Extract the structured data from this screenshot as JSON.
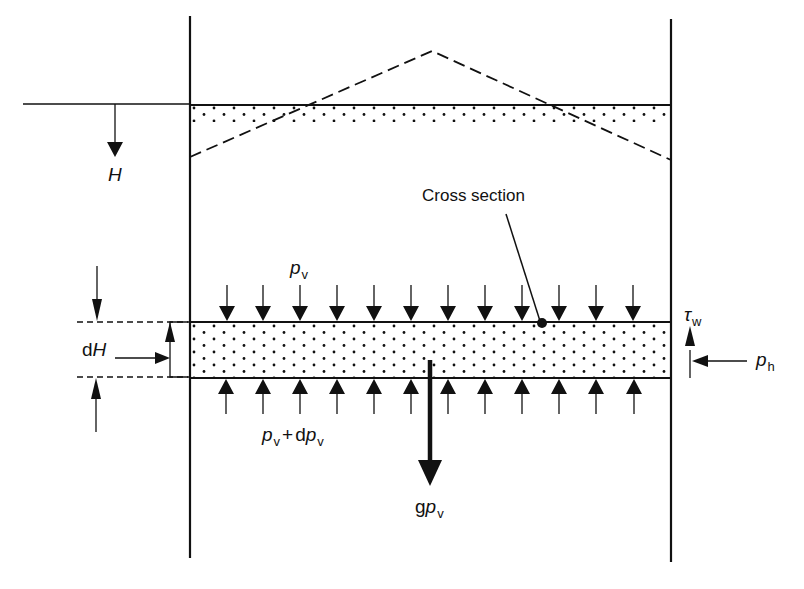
{
  "diagram": {
    "labels": {
      "depth": "H",
      "cross_section": "Cross section",
      "dH_prefix": "d",
      "dH_var": "H",
      "pv_var": "p",
      "pv_sub": "v",
      "pv_plus": "+",
      "pv_d": "d",
      "tau_var": "τ",
      "tau_sub": "w",
      "ph_var": "p",
      "ph_sub": "h",
      "g_prefix": "g"
    },
    "caption_partial": "Figure ... (caption cut off at bottom edge)"
  },
  "colors": {
    "ink": "#111111",
    "background": "#ffffff"
  },
  "geometry": {
    "left_wall_x": 190,
    "right_wall_x": 671,
    "surface_y": 105,
    "surface_band_bottom": 122,
    "dashed_peak": [
      432,
      51
    ],
    "dashed_left": [
      190,
      157
    ],
    "dashed_right": [
      671,
      160
    ],
    "slice_top_y": 322,
    "slice_bottom_y": 378,
    "pressure_arrow_x": [
      227,
      263,
      300,
      337,
      374,
      411,
      448,
      485,
      522,
      559,
      596,
      633
    ]
  }
}
